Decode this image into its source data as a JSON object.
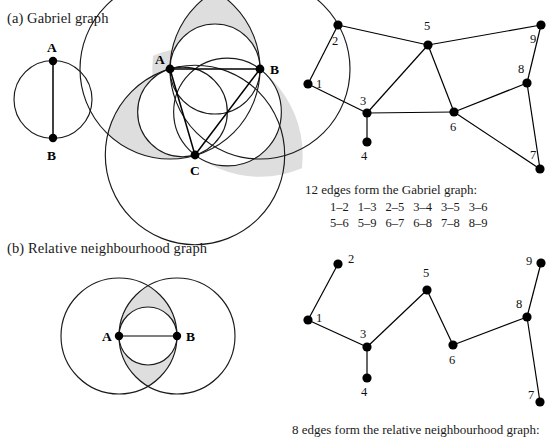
{
  "figure": {
    "panels": [
      {
        "id": "a",
        "title": "(a) Gabriel graph"
      },
      {
        "id": "b",
        "title": "(b) Relative neighbourhood graph"
      }
    ]
  },
  "gabriel": {
    "caption": "12 edges form the Gabriel graph:",
    "edge_rows": [
      [
        "1–2",
        "1–3",
        "2–5",
        "3–4",
        "3–5",
        "3–6"
      ],
      [
        "5–6",
        "5–9",
        "6–7",
        "6–8",
        "7–8",
        "8–9"
      ]
    ],
    "edge_count": 12,
    "diagram_simple": {
      "point_labels": [
        "A",
        "B"
      ],
      "points": [
        {
          "label": "A",
          "x": 53,
          "y": 61
        },
        {
          "label": "B",
          "x": 53,
          "y": 138
        }
      ],
      "circle": {
        "cx": 53,
        "cy": 99.5,
        "r": 39
      }
    },
    "diagram_triangle": {
      "point_labels": [
        "A",
        "B",
        "C"
      ],
      "points": [
        {
          "label": "A",
          "x": 170,
          "y": 69
        },
        {
          "label": "B",
          "x": 260,
          "y": 69
        },
        {
          "label": "C",
          "x": 195,
          "y": 155
        }
      ]
    },
    "graph": {
      "nodes": [
        {
          "id": "1",
          "x": 308,
          "y": 84,
          "lx": 316,
          "ly": 88
        },
        {
          "id": "2",
          "x": 338,
          "y": 25,
          "lx": 332,
          "ly": 45
        },
        {
          "id": "3",
          "x": 367,
          "y": 113,
          "lx": 360,
          "ly": 105
        },
        {
          "id": "4",
          "x": 367,
          "y": 142,
          "lx": 361,
          "ly": 160
        },
        {
          "id": "5",
          "x": 428,
          "y": 45,
          "lx": 424,
          "ly": 30
        },
        {
          "id": "6",
          "x": 454,
          "y": 112,
          "lx": 450,
          "ly": 131
        },
        {
          "id": "7",
          "x": 540,
          "y": 169,
          "lx": 530,
          "ly": 159
        },
        {
          "id": "8",
          "x": 527,
          "y": 83,
          "lx": 518,
          "ly": 73
        },
        {
          "id": "9",
          "x": 541,
          "y": 25,
          "lx": 530,
          "ly": 43
        }
      ],
      "edges": [
        [
          "1",
          "2"
        ],
        [
          "1",
          "3"
        ],
        [
          "2",
          "5"
        ],
        [
          "3",
          "4"
        ],
        [
          "3",
          "5"
        ],
        [
          "3",
          "6"
        ],
        [
          "5",
          "6"
        ],
        [
          "5",
          "9"
        ],
        [
          "6",
          "7"
        ],
        [
          "6",
          "8"
        ],
        [
          "7",
          "8"
        ],
        [
          "8",
          "9"
        ]
      ]
    }
  },
  "rng": {
    "caption": "8 edges form the relative neighbourhood graph:",
    "edge_count": 8,
    "diagram_lune": {
      "point_labels": [
        "A",
        "B"
      ],
      "points": [
        {
          "label": "A",
          "x": 119,
          "y": 336
        },
        {
          "label": "B",
          "x": 177,
          "y": 336
        }
      ],
      "radius": 58
    },
    "graph": {
      "nodes": [
        {
          "id": "1",
          "x": 308,
          "y": 320,
          "lx": 316,
          "ly": 322
        },
        {
          "id": "2",
          "x": 338,
          "y": 264,
          "lx": 348,
          "ly": 263
        },
        {
          "id": "3",
          "x": 367,
          "y": 347,
          "lx": 360,
          "ly": 338
        },
        {
          "id": "4",
          "x": 367,
          "y": 378,
          "lx": 361,
          "ly": 396
        },
        {
          "id": "5",
          "x": 427,
          "y": 290,
          "lx": 423,
          "ly": 277
        },
        {
          "id": "6",
          "x": 453,
          "y": 345,
          "lx": 449,
          "ly": 364
        },
        {
          "id": "7",
          "x": 540,
          "y": 402,
          "lx": 528,
          "ly": 399
        },
        {
          "id": "8",
          "x": 527,
          "y": 317,
          "lx": 516,
          "ly": 308
        },
        {
          "id": "9",
          "x": 541,
          "y": 263,
          "lx": 526,
          "ly": 265
        }
      ],
      "edges": [
        [
          "1",
          "2"
        ],
        [
          "1",
          "3"
        ],
        [
          "3",
          "4"
        ],
        [
          "3",
          "5"
        ],
        [
          "5",
          "6"
        ],
        [
          "6",
          "8"
        ],
        [
          "7",
          "8"
        ],
        [
          "8",
          "9"
        ]
      ]
    }
  },
  "colors": {
    "ink": "#000000",
    "shade": "#dedede",
    "background": "#ffffff"
  }
}
